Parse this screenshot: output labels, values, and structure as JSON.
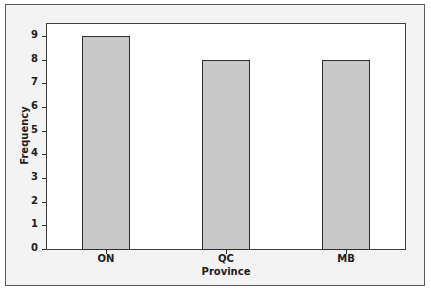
{
  "chart_data": {
    "type": "bar",
    "title": "",
    "categories": [
      "ON",
      "QC",
      "MB"
    ],
    "values": [
      9,
      8,
      8
    ],
    "xlabel": "Province",
    "ylabel": "Frequency",
    "ylim": [
      0,
      9.5
    ],
    "yticks": [
      0,
      1,
      2,
      3,
      4,
      5,
      6,
      7,
      8,
      9
    ],
    "grid": false,
    "legend": null,
    "colors": {
      "bar_fill": "#c8c8c8",
      "bar_edge": "#303030",
      "plot_bg": "#ffffff",
      "outer_bg": "#f3f3f3"
    }
  },
  "axis": {
    "x_title": "Province",
    "y_title": "Frequency",
    "y_tick_labels": [
      "0",
      "1",
      "2",
      "3",
      "4",
      "5",
      "6",
      "7",
      "8",
      "9"
    ],
    "x_tick_labels": [
      "ON",
      "QC",
      "MB"
    ]
  }
}
